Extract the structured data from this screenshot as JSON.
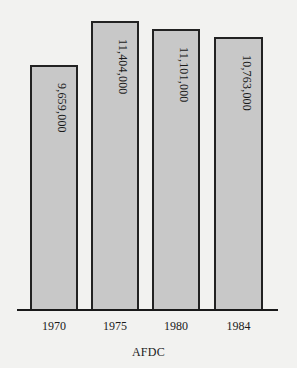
{
  "chart_data": {
    "type": "bar",
    "title": "",
    "xlabel": "AFDC",
    "ylabel": "",
    "categories": [
      "1970",
      "1975",
      "1980",
      "1984"
    ],
    "values": [
      9659000,
      11404000,
      11101000,
      10763000
    ],
    "value_labels": [
      "9,659,000",
      "11,404,000",
      "11,101,000",
      "10,763,000"
    ],
    "ylim": [
      0,
      11404000
    ],
    "grid": false,
    "legend": null,
    "label_orientation": "rotated-vertical-inside-bar",
    "colors": {
      "bar_fill": "#c8c8c8",
      "bar_border": "#222222",
      "background": "#f2f2f0",
      "axis": "#1a1a1a"
    }
  },
  "layout": {
    "baseline_y": 310,
    "px_per_unit": 2.534e-05,
    "bars": [
      {
        "left": 30,
        "width": 48
      },
      {
        "left": 91,
        "width": 48
      },
      {
        "left": 152,
        "width": 48
      },
      {
        "left": 214,
        "width": 49
      }
    ]
  }
}
